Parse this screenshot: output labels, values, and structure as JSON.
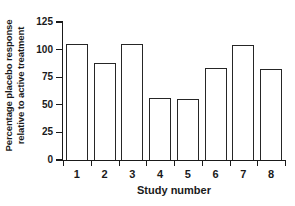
{
  "chart_data": {
    "type": "bar",
    "title": "",
    "categories": [
      "1",
      "2",
      "3",
      "4",
      "5",
      "6",
      "7",
      "8"
    ],
    "values": [
      105,
      88,
      105,
      56,
      55,
      83,
      104,
      82
    ],
    "xlabel": "Study number",
    "ylabel": "Percentage placebo response relative to active treatment",
    "ylabel_lines": [
      "Percentage placebo response",
      "relative to active treatment"
    ],
    "ylim": [
      0,
      125
    ],
    "yticks": [
      0,
      25,
      50,
      75,
      100,
      125
    ],
    "ytick_labels": [
      "0",
      "25",
      "50",
      "75",
      "100",
      "125"
    ],
    "grid": false,
    "legend": null,
    "bar_fill_color": "#ffffff",
    "bar_edge_color": "#262626",
    "axis_color": "#1a1a1a",
    "background_color": "#ffffff"
  }
}
